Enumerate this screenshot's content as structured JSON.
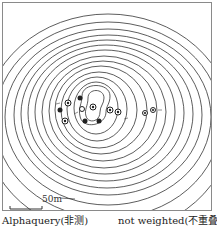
{
  "figure": {
    "type": "contour-map",
    "scale_bar_label": "50m",
    "captions": {
      "left": "Alphaquery(非测)",
      "right": "not weighted(不重叠)"
    },
    "contour_count": 16,
    "points": [
      {
        "x": 68,
        "y": 103,
        "filled": false
      },
      {
        "x": 80,
        "y": 98,
        "filled": true
      },
      {
        "x": 84,
        "y": 97,
        "filled": true
      },
      {
        "x": 60,
        "y": 110,
        "filled": true
      },
      {
        "x": 65,
        "y": 121,
        "filled": false
      },
      {
        "x": 82,
        "y": 109,
        "filled": false
      },
      {
        "x": 85,
        "y": 121,
        "filled": true
      },
      {
        "x": 93,
        "y": 107,
        "filled": false
      },
      {
        "x": 99,
        "y": 121,
        "filled": true
      },
      {
        "x": 110,
        "y": 110,
        "filled": false
      },
      {
        "x": 118,
        "y": 112,
        "filled": false
      },
      {
        "x": 145,
        "y": 113,
        "filled": false
      },
      {
        "x": 153,
        "y": 110,
        "filled": false
      }
    ],
    "colors": {
      "line": "#333333",
      "frame": "#8a8a8a",
      "background": "#ffffff"
    }
  }
}
